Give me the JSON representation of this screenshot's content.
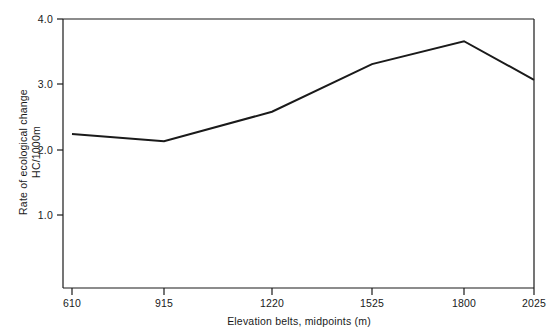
{
  "chart_data": {
    "type": "line",
    "title": "",
    "subtitle": "",
    "xlabel": "Elevation belts, midpoints (m)",
    "ylabel_line1": "Rate of ecological change",
    "ylabel_line2": "HC/1000m",
    "ylabel": "Rate of ecological change HC/1000m",
    "categories": [
      "610",
      "915",
      "1220",
      "1525",
      "1800",
      "2025"
    ],
    "x": [
      610,
      915,
      1220,
      1525,
      1800,
      2025
    ],
    "values": [
      2.24,
      2.13,
      2.58,
      3.31,
      3.66,
      3.07
    ],
    "series": [
      {
        "name": "Rate of ecological change",
        "values": [
          2.24,
          2.13,
          2.58,
          3.31,
          3.66,
          3.07
        ]
      }
    ],
    "xtick_labels": [
      "610",
      "915",
      "1220",
      "1525",
      "1800",
      "2025"
    ],
    "ytick_labels": [
      "1.0",
      "2.0",
      "3.0",
      "4.0"
    ],
    "ytick_values": [
      1.0,
      2.0,
      3.0,
      4.0
    ],
    "ylim": [
      0.0,
      4.0
    ],
    "xlim": [
      610,
      2025
    ],
    "grid": false,
    "legend": false,
    "legend_position": "none",
    "line_color": "#1a1a1a",
    "background_color": "#ffffff",
    "axis_color": "#1a1a1a",
    "annotations": []
  },
  "figure": {
    "name": "rate-of-ecological-change-by-elevation"
  }
}
